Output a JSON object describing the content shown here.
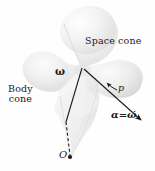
{
  "figure": {
    "type": "technical-illustration",
    "background_color": "#fefefe",
    "ink_color": "#1a1a1a",
    "cone_fill_light": "#f4f4f4",
    "cone_fill_mid": "#e9e9e9",
    "cone_fill_dark": "#d8d8d8"
  },
  "labels": {
    "space_cone": "Space cone",
    "body_cone_line1": "Body",
    "body_cone_line2": "cone",
    "omega": "ω",
    "p": "p",
    "alpha_symbol": "α",
    "equals": "=",
    "omega_dot": "ω̇",
    "origin": "O"
  },
  "geometry": {
    "apex": [
      82,
      68
    ],
    "omega_axis_end": [
      66,
      122
    ],
    "origin_point": [
      70,
      158
    ],
    "alpha_arrow_end": [
      143,
      122
    ],
    "p_arrow_tip": [
      106,
      84
    ]
  }
}
